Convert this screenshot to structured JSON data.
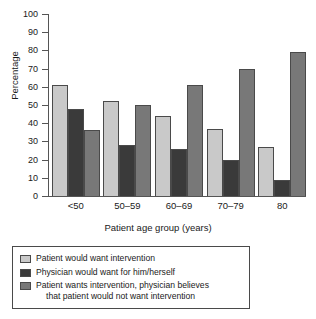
{
  "chart_data": {
    "type": "bar",
    "title": "",
    "xlabel": "Patient age group (years)",
    "ylabel": "Percentage",
    "categories": [
      "<50",
      "50–59",
      "60–69",
      "70–79",
      "80"
    ],
    "ylim": [
      0,
      100
    ],
    "yticks": [
      0,
      10,
      20,
      30,
      40,
      50,
      60,
      70,
      80,
      90,
      100
    ],
    "grid": false,
    "legend_position": "below-plot",
    "series": [
      {
        "name": "Patient would want intervention",
        "color": "#c9c9c9",
        "values": [
          61,
          52,
          44,
          37,
          27
        ]
      },
      {
        "name": "Physician would want for him/herself",
        "color": "#3a3a3a",
        "values": [
          48,
          28,
          26,
          20,
          9
        ]
      },
      {
        "name": "Patient wants intervention, physician believes that patient would not want intervention",
        "color": "#787878",
        "values": [
          36,
          50,
          61,
          70,
          79
        ]
      }
    ]
  },
  "legend": {
    "items": [
      {
        "label": "Patient would want intervention",
        "continuation": ""
      },
      {
        "label": "Physician would want for him/herself",
        "continuation": ""
      },
      {
        "label": "Patient wants intervention, physician believes",
        "continuation": "that patient would not want intervention"
      }
    ]
  },
  "axes": {
    "y_title": "Percentage",
    "x_title": "Patient age group (years)",
    "y_tick_labels": [
      "100",
      "90",
      "80",
      "70",
      "60",
      "50",
      "40",
      "30",
      "20",
      "10",
      "0"
    ],
    "x_tick_labels": [
      "<50",
      "50–59",
      "60–69",
      "70–79",
      "80"
    ]
  }
}
